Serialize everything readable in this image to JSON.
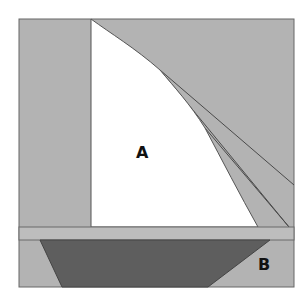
{
  "diagram": {
    "type": "sailboat-area-diagram",
    "labels": {
      "sail": "A",
      "hull": "B"
    },
    "colors": {
      "background": "#ffffff",
      "panel": "#b3b3b3",
      "band": "#bdbdbd",
      "sail": "#ffffff",
      "hull": "#5e5e5e",
      "stroke": "#555555",
      "text": "#111111"
    },
    "regions": [
      {
        "name": "sail",
        "label": "A",
        "color": "white"
      },
      {
        "name": "hull",
        "label": "B",
        "color": "dark gray"
      }
    ]
  }
}
